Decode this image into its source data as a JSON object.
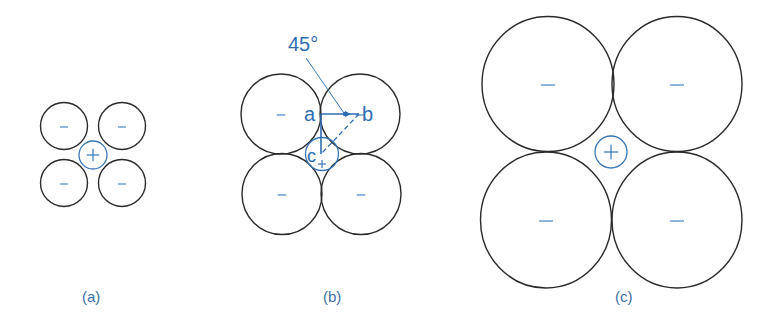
{
  "figure": {
    "colors": {
      "anion_outline": "#2a2a2a",
      "cation_outline": "#3b76b8",
      "label_blue": "#2f6db3",
      "background": "#ffffff"
    },
    "panels": [
      {
        "id": "a",
        "caption": "(a)",
        "caption_pos": {
          "x": 82,
          "y": 302
        },
        "anions": [
          {
            "cx": 64,
            "cy": 126,
            "rx": 23.5,
            "ry": 23.5,
            "sign": "–"
          },
          {
            "cx": 122,
            "cy": 126,
            "rx": 23.5,
            "ry": 23.5,
            "sign": "–"
          },
          {
            "cx": 64,
            "cy": 183,
            "rx": 23.5,
            "ry": 23.5,
            "sign": "–"
          },
          {
            "cx": 122,
            "cy": 183,
            "rx": 23.5,
            "ry": 23.5,
            "sign": "–"
          }
        ],
        "cation": {
          "cx": 93,
          "cy": 155,
          "r": 14,
          "sign": "+"
        }
      },
      {
        "id": "b",
        "caption": "(b)",
        "caption_pos": {
          "x": 323,
          "y": 302
        },
        "anions": [
          {
            "cx": 281,
            "cy": 114,
            "rx": 40,
            "ry": 40,
            "sign": "–"
          },
          {
            "cx": 360,
            "cy": 114,
            "rx": 40,
            "ry": 40,
            "sign": "–"
          },
          {
            "cx": 282,
            "cy": 194,
            "rx": 40,
            "ry": 40.5,
            "sign": "–"
          },
          {
            "cx": 361,
            "cy": 194,
            "rx": 40,
            "ry": 40.5,
            "sign": "–"
          }
        ],
        "cation": {
          "cx": 322,
          "cy": 154,
          "r": 16.5,
          "sign": "+"
        },
        "points": {
          "a": {
            "label": "a",
            "x": 321,
            "y": 114
          },
          "b": {
            "label": "b",
            "x": 359,
            "y": 114
          },
          "c": {
            "label": "c",
            "x": 321,
            "y": 154
          }
        },
        "angle_label": "45°",
        "angle_label_pos": {
          "x": 288,
          "y": 51
        }
      },
      {
        "id": "c",
        "caption": "(c)",
        "caption_pos": {
          "x": 615,
          "y": 302
        },
        "anions": [
          {
            "cx": 548,
            "cy": 84,
            "rx": 66,
            "ry": 67.5,
            "sign": "–"
          },
          {
            "cx": 677,
            "cy": 84,
            "rx": 65,
            "ry": 67.5,
            "sign": "–"
          },
          {
            "cx": 546,
            "cy": 220,
            "rx": 65.5,
            "ry": 68,
            "sign": "–"
          },
          {
            "cx": 677,
            "cy": 220,
            "rx": 65,
            "ry": 68,
            "sign": "–"
          }
        ],
        "cation": {
          "cx": 611,
          "cy": 152,
          "r": 16,
          "sign": "+"
        }
      }
    ]
  }
}
